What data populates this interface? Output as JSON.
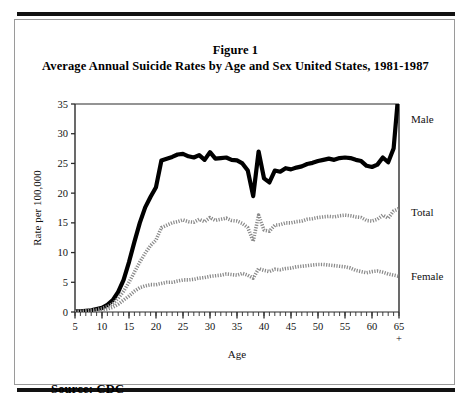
{
  "figure": {
    "title_line1": "Figure 1",
    "title_line2": "Average Annual Suicide Rates by Age and Sex United States, 1981-1987",
    "source": "Source: CDC"
  },
  "chart_data": {
    "type": "line",
    "title": "Average Annual Suicide Rates by Age and Sex United States, 1981-1987",
    "subtitle": "Figure 1",
    "xlabel": "Age",
    "ylabel": "Rate per 100,000",
    "xlim": [
      5,
      65
    ],
    "ylim": [
      0,
      35
    ],
    "ytick_values": [
      0,
      5,
      10,
      15,
      20,
      25,
      30,
      35
    ],
    "ytick_labels": [
      "0",
      "5",
      "10",
      "15",
      "20",
      "25",
      "30",
      "35"
    ],
    "xtick_values": [
      5,
      10,
      15,
      20,
      25,
      30,
      35,
      40,
      45,
      50,
      55,
      60,
      65
    ],
    "xtick_labels": [
      "5",
      "10",
      "15",
      "20",
      "25",
      "30",
      "35",
      "40",
      "45",
      "50",
      "55",
      "60",
      "65"
    ],
    "xtick_suffix_last": "+",
    "minor_tick_step": 1,
    "grid": false,
    "legend_position": "right-inline",
    "x": [
      5,
      6,
      7,
      8,
      9,
      10,
      11,
      12,
      13,
      14,
      15,
      16,
      17,
      18,
      19,
      20,
      21,
      22,
      23,
      24,
      25,
      26,
      27,
      28,
      29,
      30,
      31,
      32,
      33,
      34,
      35,
      36,
      37,
      38,
      39,
      40,
      41,
      42,
      43,
      44,
      45,
      46,
      47,
      48,
      49,
      50,
      51,
      52,
      53,
      54,
      55,
      56,
      57,
      58,
      59,
      60,
      61,
      62,
      63,
      64,
      65
    ],
    "series": [
      {
        "name": "Male",
        "style": "thick-solid-black",
        "color": "#000000",
        "values": [
          0.1,
          0.1,
          0.2,
          0.3,
          0.5,
          0.7,
          1.2,
          2.0,
          3.4,
          5.4,
          8.4,
          11.8,
          15.0,
          17.6,
          19.4,
          21.0,
          25.5,
          25.8,
          26.1,
          26.5,
          26.6,
          26.2,
          26.0,
          26.4,
          25.6,
          26.9,
          25.8,
          25.9,
          26.0,
          25.6,
          25.5,
          25.0,
          23.8,
          19.5,
          27.0,
          22.5,
          21.8,
          23.8,
          23.6,
          24.2,
          24.0,
          24.3,
          24.5,
          24.9,
          25.1,
          25.4,
          25.6,
          25.8,
          25.6,
          25.9,
          26.0,
          25.9,
          25.6,
          25.4,
          24.6,
          24.4,
          24.8,
          26.0,
          25.2,
          27.5,
          38.0
        ]
      },
      {
        "name": "Total",
        "style": "hatched-gray",
        "color": "#8a8a8a",
        "values": [
          0.1,
          0.1,
          0.2,
          0.3,
          0.4,
          0.6,
          0.9,
          1.4,
          2.3,
          3.5,
          5.0,
          6.7,
          8.4,
          9.9,
          11.2,
          12.1,
          14.2,
          14.6,
          15.0,
          15.2,
          15.5,
          15.2,
          15.1,
          15.6,
          15.2,
          15.9,
          15.4,
          15.6,
          15.8,
          15.4,
          15.3,
          14.9,
          14.2,
          11.9,
          16.3,
          13.8,
          13.6,
          14.6,
          14.7,
          15.0,
          15.0,
          15.2,
          15.3,
          15.6,
          15.7,
          15.9,
          16.0,
          16.1,
          16.0,
          16.2,
          16.3,
          16.2,
          16.0,
          15.9,
          15.4,
          15.3,
          15.6,
          16.3,
          15.8,
          17.0,
          17.4
        ]
      },
      {
        "name": "Female",
        "style": "hatched-gray",
        "color": "#8a8a8a",
        "values": [
          0.05,
          0.05,
          0.1,
          0.1,
          0.2,
          0.3,
          0.5,
          0.8,
          1.3,
          2.0,
          2.7,
          3.5,
          4.1,
          4.4,
          4.6,
          4.6,
          4.8,
          5.0,
          5.0,
          5.2,
          5.4,
          5.4,
          5.5,
          5.7,
          5.8,
          6.0,
          6.1,
          6.2,
          6.4,
          6.3,
          6.2,
          6.5,
          6.2,
          5.7,
          7.3,
          7.0,
          6.8,
          7.2,
          7.1,
          7.3,
          7.4,
          7.6,
          7.7,
          7.8,
          7.9,
          8.0,
          8.0,
          7.9,
          7.8,
          7.7,
          7.6,
          7.4,
          7.0,
          6.8,
          6.6,
          6.8,
          6.9,
          6.7,
          6.4,
          6.2,
          6.0
        ]
      }
    ]
  },
  "series_labels": [
    {
      "name": "Male",
      "text": "Male"
    },
    {
      "name": "Total",
      "text": "Total"
    },
    {
      "name": "Female",
      "text": "Female"
    }
  ]
}
